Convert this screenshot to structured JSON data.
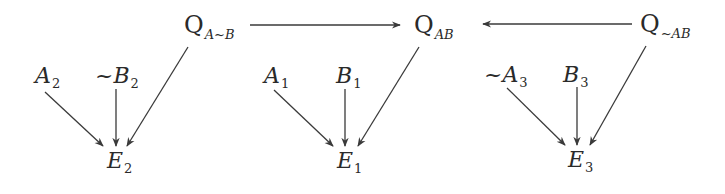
{
  "diagram": {
    "type": "causal-graph",
    "stroke_color": "#3a3a3a",
    "text_color": "#2a2a2a",
    "nodes": {
      "q_a_notb": {
        "main": "Q",
        "sub": "A~B"
      },
      "q_ab": {
        "main": "Q",
        "sub": "AB"
      },
      "q_nota_b": {
        "main": "Q",
        "sub": "~AB"
      },
      "a2": {
        "main": "A",
        "sub": "2"
      },
      "notb2": {
        "main": "~B",
        "sub": "2"
      },
      "e2": {
        "main": "E",
        "sub": "2"
      },
      "a1": {
        "main": "A",
        "sub": "1"
      },
      "b1": {
        "main": "B",
        "sub": "1"
      },
      "e1": {
        "main": "E",
        "sub": "1"
      },
      "nota3": {
        "main": "~A",
        "sub": "3"
      },
      "b3": {
        "main": "B",
        "sub": "3"
      },
      "e3": {
        "main": "E",
        "sub": "3"
      }
    },
    "edges": [
      {
        "from": "Q_A~B",
        "to": "Q_AB"
      },
      {
        "from": "Q_~AB",
        "to": "Q_AB"
      },
      {
        "from": "A_2",
        "to": "E_2"
      },
      {
        "from": "~B_2",
        "to": "E_2"
      },
      {
        "from": "Q_A~B",
        "to": "E_2"
      },
      {
        "from": "A_1",
        "to": "E_1"
      },
      {
        "from": "B_1",
        "to": "E_1"
      },
      {
        "from": "Q_AB",
        "to": "E_1"
      },
      {
        "from": "~A_3",
        "to": "E_3"
      },
      {
        "from": "B_3",
        "to": "E_3"
      },
      {
        "from": "Q_~AB",
        "to": "E_3"
      }
    ]
  }
}
